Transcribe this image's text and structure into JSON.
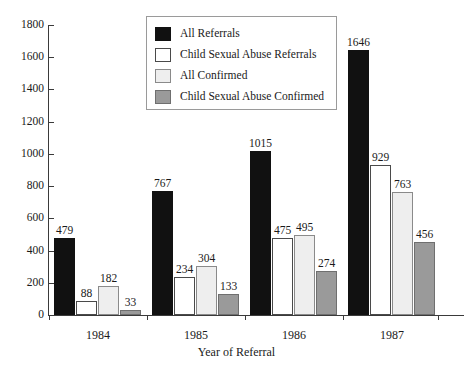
{
  "chart_data": {
    "type": "bar",
    "title": "",
    "xlabel": "Year of Referral",
    "ylabel": "",
    "categories": [
      "1984",
      "1985",
      "1986",
      "1987"
    ],
    "ylim": [
      0,
      1800
    ],
    "yticks": [
      0,
      200,
      400,
      600,
      800,
      1000,
      1200,
      1400,
      1600,
      1800
    ],
    "ytick_labels": [
      "0",
      "200",
      "400",
      "600",
      "800",
      "1000",
      "1200",
      "1400",
      "1600",
      "1800"
    ],
    "grid": false,
    "legend_position": "top-center",
    "series": [
      {
        "name": "All Referrals",
        "color": "#111111",
        "values": [
          479,
          767,
          1015,
          1646
        ]
      },
      {
        "name": "Child Sexual Abuse Referrals",
        "color": "#ffffff",
        "values": [
          88,
          234,
          475,
          929
        ]
      },
      {
        "name": "All Confirmed",
        "color": "#eeeeee",
        "values": [
          182,
          304,
          495,
          763
        ]
      },
      {
        "name": "Child Sexual Abuse Confirmed",
        "color": "#9a9a9a",
        "values": [
          33,
          133,
          274,
          456
        ]
      }
    ],
    "data_labels": [
      [
        "479",
        "88",
        "182",
        "33"
      ],
      [
        "767",
        "234",
        "304",
        "133"
      ],
      [
        "1015",
        "475",
        "495",
        "274"
      ],
      [
        "1646",
        "929",
        "763",
        "456"
      ]
    ]
  },
  "legend": {
    "items": [
      {
        "label": "All Referrals"
      },
      {
        "label": "Child Sexual Abuse Referrals"
      },
      {
        "label": "All Confirmed"
      },
      {
        "label": "Child Sexual Abuse Confirmed"
      }
    ]
  }
}
